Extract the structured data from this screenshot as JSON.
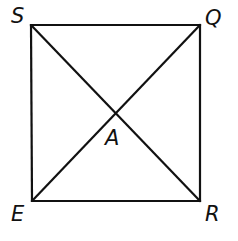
{
  "diagram": {
    "type": "square-with-diagonals",
    "stroke_color": "#111111",
    "background": "#ffffff",
    "vertices": {
      "S": {
        "label": "S",
        "position": "top-left"
      },
      "Q": {
        "label": "Q",
        "position": "top-right"
      },
      "R": {
        "label": "R",
        "position": "bottom-right"
      },
      "E": {
        "label": "E",
        "position": "bottom-left"
      }
    },
    "intersection": {
      "label": "A",
      "position": "center, below intersection"
    },
    "segments": [
      "SQ",
      "QR",
      "RE",
      "ES",
      "SR",
      "EQ"
    ]
  }
}
